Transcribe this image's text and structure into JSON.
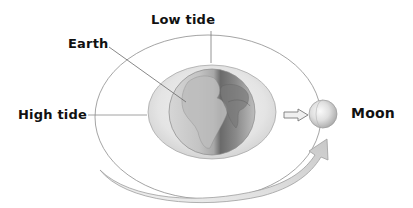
{
  "diagram": {
    "labels": {
      "low_tide": "Low tide",
      "earth": "Earth",
      "high_tide": "High tide",
      "moon": "Moon"
    },
    "elements": [
      {
        "name": "orbit-ellipse",
        "description": "thin gray elliptical orbit path around Earth"
      },
      {
        "name": "tidal-bulge",
        "description": "light gray ellipse representing ocean bulge around Earth"
      },
      {
        "name": "earth-globe",
        "description": "shaded globe showing Africa and Europe, half lit"
      },
      {
        "name": "gravity-arrow",
        "description": "small hollow arrow pointing from Earth toward Moon"
      },
      {
        "name": "moon",
        "description": "small shaded sphere"
      },
      {
        "name": "orbit-direction-arrow",
        "description": "large curved gray arrow showing Moon's orbital motion"
      }
    ],
    "colors": {
      "text": "#111111",
      "line": "#8a8a8a",
      "bulge": "#e2e2e2",
      "earth_light": "#d8d8d8",
      "earth_dark": "#6e6e6e",
      "arrow": "#d0d0d0"
    }
  }
}
